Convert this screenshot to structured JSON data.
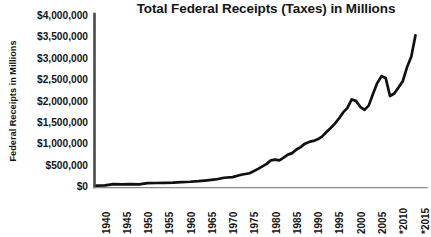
{
  "chart_data": {
    "type": "line",
    "title": "Total Federal Receipts (Taxes) in Millions",
    "xlabel": "",
    "ylabel": "Federal Receipts in Millions",
    "ylim": [
      0,
      4000000
    ],
    "xlim": [
      1940,
      2015
    ],
    "grid": false,
    "legend": null,
    "legend_position": "none",
    "line_color": "#101010",
    "axis_color": "#5a5a5a",
    "y_ticks": [
      "$4,000,000",
      "$3,500,000",
      "$3,000,000",
      "$2,500,000",
      "$2,000,000",
      "$1,500,000",
      "$1,000,000",
      "$500,000",
      "$0"
    ],
    "y_tick_values": [
      4000000,
      3500000,
      3000000,
      2500000,
      2000000,
      1500000,
      1000000,
      500000,
      0
    ],
    "x_ticks": [
      "1940",
      "1945",
      "1950",
      "1955",
      "1960",
      "1965",
      "1970",
      "1975",
      "1980",
      "1985",
      "1990",
      "1995",
      "2000",
      "2005",
      "*2010",
      "*2015"
    ],
    "x_tick_values": [
      1940,
      1945,
      1950,
      1955,
      1960,
      1965,
      1970,
      1975,
      1980,
      1985,
      1990,
      1995,
      2000,
      2005,
      2010,
      2015
    ],
    "annotation": "Asterisk (*) on 2010 and 2015 denotes estimated/projected values",
    "series": [
      {
        "name": "Total Federal Receipts",
        "x": [
          1940,
          1942,
          1944,
          1946,
          1948,
          1950,
          1952,
          1954,
          1956,
          1958,
          1960,
          1962,
          1964,
          1966,
          1968,
          1970,
          1972,
          1974,
          1976,
          1978,
          1980,
          1981,
          1982,
          1983,
          1984,
          1985,
          1986,
          1987,
          1988,
          1989,
          1990,
          1991,
          1992,
          1993,
          1994,
          1995,
          1996,
          1997,
          1998,
          1999,
          2000,
          2001,
          2002,
          2003,
          2004,
          2005,
          2006,
          2007,
          2008,
          2009,
          2010,
          2011,
          2012,
          2013,
          2014,
          2015
        ],
        "values": [
          6548,
          14634,
          43747,
          39296,
          41560,
          39443,
          66167,
          69719,
          74587,
          79636,
          92492,
          99676,
          112613,
          130835,
          152973,
          192807,
          207309,
          263224,
          298060,
          399561,
          517112,
          599272,
          617766,
          600562,
          666438,
          734037,
          769155,
          854288,
          909238,
          991105,
          1031958,
          1055041,
          1091208,
          1154335,
          1258566,
          1351790,
          1453053,
          1579232,
          1721728,
          1827452,
          2025191,
          1991082,
          1853136,
          1782314,
          1880114,
          2153611,
          2406869,
          2567985,
          2523991,
          2104989,
          2162706,
          2303466,
          2449988,
          2775103,
          3021487,
          3525000
        ]
      }
    ]
  }
}
